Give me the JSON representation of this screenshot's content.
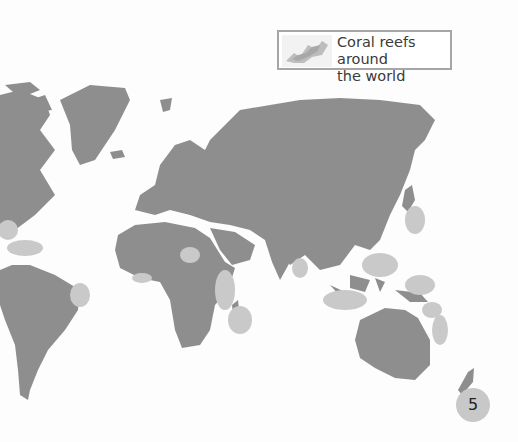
{
  "legend": {
    "label": "Coral reefs around the world",
    "line1": "Coral reefs around",
    "line2": "the world",
    "swatch_icon": "coral-reef-pattern-icon"
  },
  "page_number": "5",
  "colors": {
    "land": "#8e8e8e",
    "reef": "#c9c9c9",
    "ocean": "#fdfdfd",
    "legend_border": "#a6a6a6",
    "page_badge": "#c8c8c8"
  },
  "regions": [
    "North America",
    "Greenland",
    "Iceland",
    "Europe",
    "Asia",
    "Africa",
    "Madagascar",
    "South America",
    "Australia",
    "New Zealand",
    "Japan",
    "Indonesia",
    "New Guinea",
    "Arabian Peninsula",
    "India"
  ]
}
